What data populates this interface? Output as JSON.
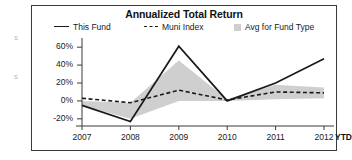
{
  "chart": {
    "title": "Annualized Total Return",
    "legend": [
      {
        "label": "This Fund",
        "marker": "solid-line",
        "color": "#1a1a1a"
      },
      {
        "label": "Muni Index",
        "marker": "dashed-line",
        "color": "#1a1a1a"
      },
      {
        "label": "Avg for Fund Type",
        "marker": "filled-square",
        "color": "#cfcfcf"
      }
    ],
    "ytd_label": "YTD"
  },
  "chart_data": {
    "type": "line",
    "title": "Annualized Total Return",
    "xlabel": "",
    "ylabel": "",
    "grid": false,
    "legend_position": "top",
    "categories": [
      "2007",
      "2008",
      "2009",
      "2010",
      "2011",
      "2012"
    ],
    "x_tick_labels": [
      "2007",
      "2008",
      "2009",
      "2010",
      "2011",
      "2012"
    ],
    "x_extra_label": "YTD",
    "y_tick_labels": [
      "60%",
      "40%",
      "20%",
      "0%",
      "-20%"
    ],
    "y_ticks": [
      60,
      40,
      20,
      0,
      -20
    ],
    "ylim": [
      -28,
      68
    ],
    "series": [
      {
        "name": "This Fund",
        "type": "line",
        "style": "solid",
        "color": "#1a1a1a",
        "values": [
          -5,
          -23,
          61,
          0,
          20,
          47
        ]
      },
      {
        "name": "Muni Index",
        "type": "line",
        "style": "dashed",
        "color": "#1a1a1a",
        "values": [
          3,
          -2,
          12,
          1,
          10,
          9
        ]
      },
      {
        "name": "Avg for Fund Type",
        "type": "band",
        "style": "filled",
        "color": "#cfcfcf",
        "upper_values": [
          0,
          -2,
          45,
          2,
          18,
          15
        ],
        "lower_values": [
          -5,
          -20,
          0,
          0,
          2,
          3
        ]
      }
    ]
  }
}
